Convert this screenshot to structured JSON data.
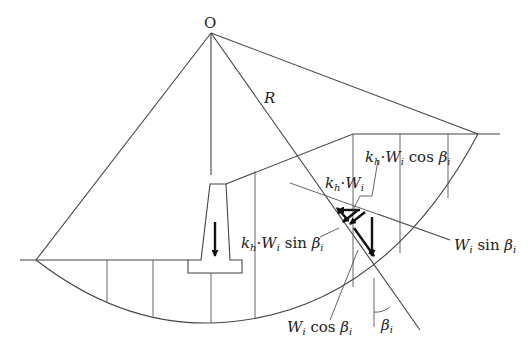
{
  "diagram": {
    "type": "circular slip surface slope stability with seismic coefficient",
    "labels": {
      "center": "O",
      "radius": "R",
      "kh_W": {
        "k": "k",
        "h": "h",
        "dot": "·",
        "W": "W",
        "i": "i"
      },
      "kh_W_cos": {
        "k": "k",
        "h": "h",
        "dot": "·",
        "W": "W",
        "i": "i",
        "fn": " cos ",
        "beta": "β",
        "bi": "i"
      },
      "kh_W_sin": {
        "k": "k",
        "h": "h",
        "dot": "·",
        "W": "W",
        "i": "i",
        "fn": " sin ",
        "beta": "β",
        "bi": "i"
      },
      "W_sin": {
        "W": "W",
        "i": "i",
        "fn": " sin ",
        "beta": "β",
        "bi": "i"
      },
      "W_cos": {
        "W": "W",
        "i": "i",
        "fn": " cos ",
        "beta": "β",
        "bi": "i"
      },
      "beta_angle": {
        "beta": "β",
        "bi": "i"
      }
    },
    "colors": {
      "line": "#444444",
      "vector": "#111111",
      "text": "#222222",
      "background": "#ffffff"
    }
  }
}
